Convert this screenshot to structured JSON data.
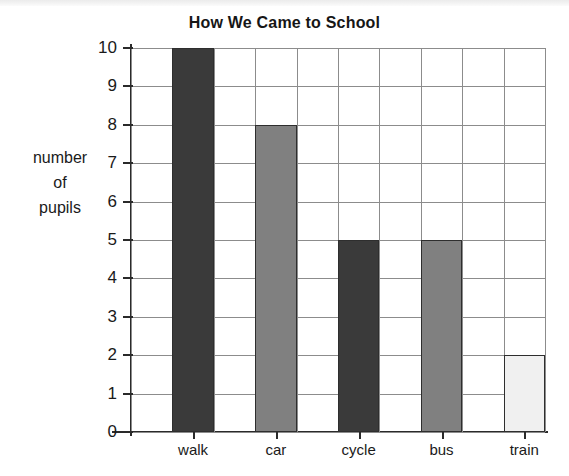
{
  "chart_data": {
    "type": "bar",
    "title": "How We Came to School",
    "xlabel": "",
    "ylabel": "number of pupils",
    "ylabel_lines": [
      "number",
      "of",
      "pupils"
    ],
    "categories": [
      "walk",
      "car",
      "cycle",
      "bus",
      "train"
    ],
    "values": [
      10,
      8,
      5,
      5,
      2
    ],
    "ylim": [
      0,
      10
    ],
    "ytick_labels": [
      "0",
      "1",
      "2",
      "3",
      "4",
      "5",
      "6",
      "7",
      "8",
      "9",
      "10"
    ],
    "grid": true,
    "legend": "none",
    "bar_colors": [
      "#3a3a3a",
      "#808080",
      "#3a3a3a",
      "#808080",
      "#f0f0f0"
    ],
    "bar_outline_color": "#2e2e2e",
    "gridline_color": "#8c8c8c",
    "axis_color": "#2a2a2a",
    "background_color": "#ffffff"
  }
}
